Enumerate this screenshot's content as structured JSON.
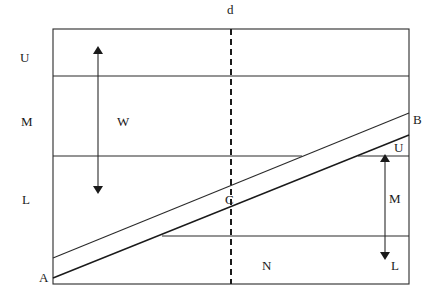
{
  "diagram": {
    "labels": {
      "top_dashed": "d",
      "left_upper": "U",
      "left_middle": "M",
      "left_lower": "L",
      "arrow_left": "W",
      "point_a": "A",
      "point_b": "B",
      "point_c": "C",
      "right_upper": "U",
      "right_middle": "M",
      "right_lower": "L",
      "bottom_region": "N"
    },
    "colors": {
      "line": "#2a2a2a",
      "background": "#ffffff"
    }
  }
}
